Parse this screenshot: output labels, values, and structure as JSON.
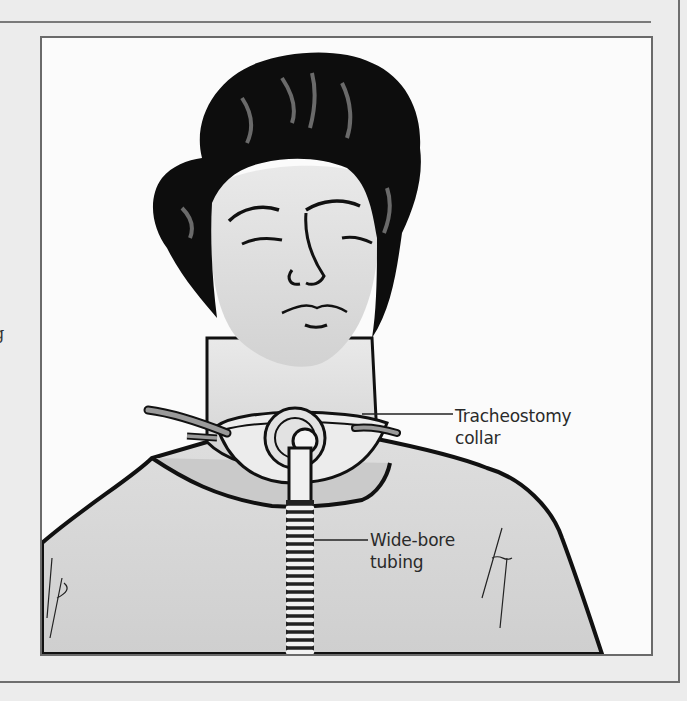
{
  "page": {
    "left_edge_fragment": "g"
  },
  "figure": {
    "labels": [
      {
        "id": "tracheostomy-collar",
        "line1": "Tracheostomy",
        "line2": "collar"
      },
      {
        "id": "wide-bore-tubing",
        "line1": "Wide-bore",
        "line2": "tubing"
      }
    ]
  },
  "colors": {
    "page_background": "#ececec",
    "frame_border": "#6a6a6a",
    "figure_background": "#fbfbfb",
    "shading": "#d6d6d6",
    "ink": "#111111"
  }
}
